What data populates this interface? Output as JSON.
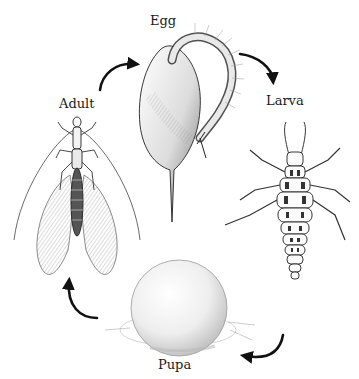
{
  "diagram": {
    "type": "life-cycle",
    "stages": [
      {
        "id": "egg",
        "label": "Egg"
      },
      {
        "id": "larva",
        "label": "Larva"
      },
      {
        "id": "pupa",
        "label": "Pupa"
      },
      {
        "id": "adult",
        "label": "Adult"
      }
    ],
    "flow": [
      "egg",
      "larva",
      "pupa",
      "adult",
      "egg"
    ],
    "colors": {
      "ink": "#1a1a1a",
      "shade": "#8a8a8a",
      "background": "#ffffff"
    }
  }
}
